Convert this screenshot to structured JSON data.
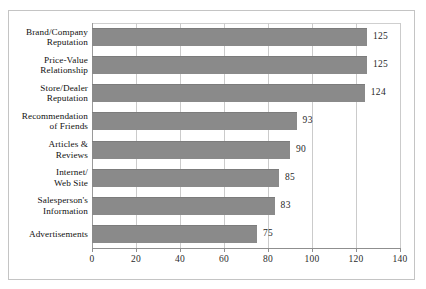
{
  "chart_data": {
    "type": "bar",
    "orientation": "horizontal",
    "title": "",
    "xlabel": "",
    "ylabel": "",
    "xlim": [
      0,
      140
    ],
    "xticks": [
      0,
      20,
      40,
      60,
      80,
      100,
      120,
      140
    ],
    "xtick_labels": [
      "0",
      "20",
      "40",
      "60",
      "80",
      "100",
      "120",
      "140"
    ],
    "grid": "vertical",
    "legend": "none",
    "categories": [
      "Brand/Company Reputation",
      "Price-Value Relationship",
      "Store/Dealer Reputation",
      "Recommendation of Friends",
      "Articles & Reviews",
      "Internet/ Web Site",
      "Salesperson's Information",
      "Advertisements"
    ],
    "category_lines": [
      [
        "Brand/Company",
        "Reputation"
      ],
      [
        "Price-Value",
        "Relationship"
      ],
      [
        "Store/Dealer",
        "Reputation"
      ],
      [
        "Recommendation",
        "of Friends"
      ],
      [
        "Articles &",
        "Reviews"
      ],
      [
        "Internet/",
        "Web Site"
      ],
      [
        "Salesperson's",
        "Information"
      ],
      [
        "Advertisements"
      ]
    ],
    "values": [
      125,
      125,
      124,
      93,
      90,
      85,
      83,
      75
    ],
    "value_labels": [
      "125",
      "125",
      "124",
      "93",
      "90",
      "85",
      "83",
      "75"
    ],
    "colors": {
      "bar": "#8a8a8a",
      "bar_edge": "#7c7c7c",
      "grid": "#cbcbcb",
      "axis": "#8f8f8f",
      "frame": "#c4c4c4",
      "text": "#111111",
      "background": "#ffffff"
    }
  }
}
